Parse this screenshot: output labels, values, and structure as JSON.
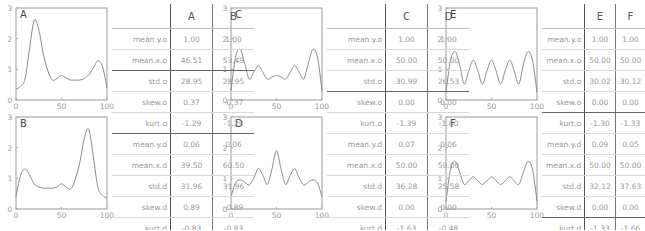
{
  "chart_data": [
    {
      "type": "line",
      "title": "A",
      "xlim": [
        0,
        100
      ],
      "ylim": [
        0,
        3
      ],
      "xticks": [
        0,
        50,
        100
      ],
      "yticks": [
        0,
        1,
        2,
        3
      ],
      "x": [
        0,
        5,
        10,
        15,
        20,
        25,
        30,
        35,
        40,
        45,
        50,
        55,
        60,
        65,
        70,
        75,
        80,
        85,
        90,
        95,
        100
      ],
      "values": [
        0.35,
        0.45,
        0.7,
        1.7,
        2.6,
        2.3,
        1.5,
        0.95,
        0.65,
        0.7,
        0.8,
        0.72,
        0.65,
        0.65,
        0.65,
        0.7,
        0.82,
        1.05,
        1.28,
        1.1,
        0.4
      ]
    },
    {
      "type": "line",
      "title": "B",
      "xlim": [
        0,
        100
      ],
      "ylim": [
        0,
        3
      ],
      "xticks": [
        0,
        50,
        100
      ],
      "yticks": [
        0,
        1,
        2,
        3
      ],
      "x": [
        0,
        5,
        10,
        15,
        20,
        25,
        30,
        35,
        40,
        45,
        50,
        55,
        60,
        65,
        70,
        75,
        80,
        85,
        90,
        95,
        100
      ],
      "values": [
        0.4,
        1.1,
        1.3,
        1.1,
        0.82,
        0.72,
        0.68,
        0.68,
        0.68,
        0.72,
        0.82,
        0.72,
        0.65,
        0.95,
        1.5,
        2.3,
        2.6,
        1.7,
        0.7,
        0.45,
        0.35
      ]
    },
    {
      "type": "line",
      "title": "C",
      "xlim": [
        0,
        100
      ],
      "ylim": [
        0,
        3
      ],
      "xticks": [
        0,
        50,
        100
      ],
      "yticks": [
        0,
        1,
        2,
        3
      ],
      "x": [
        0,
        5,
        10,
        15,
        20,
        25,
        30,
        35,
        40,
        45,
        50,
        55,
        60,
        65,
        70,
        75,
        80,
        85,
        90,
        95,
        100
      ],
      "values": [
        0.3,
        1.4,
        1.65,
        1.2,
        0.68,
        0.9,
        1.12,
        0.9,
        0.68,
        0.75,
        0.8,
        0.75,
        0.68,
        0.9,
        1.12,
        0.9,
        0.68,
        1.2,
        1.65,
        1.4,
        0.3
      ]
    },
    {
      "type": "line",
      "title": "D",
      "xlim": [
        0,
        100
      ],
      "ylim": [
        0,
        3
      ],
      "xticks": [
        0,
        50,
        100
      ],
      "yticks": [
        0,
        1,
        2,
        3
      ],
      "x": [
        0,
        5,
        10,
        15,
        20,
        25,
        30,
        35,
        40,
        45,
        50,
        55,
        60,
        65,
        70,
        75,
        80,
        85,
        90,
        95,
        100
      ],
      "values": [
        0.4,
        0.85,
        0.95,
        0.88,
        0.78,
        1.0,
        1.32,
        1.1,
        0.8,
        1.3,
        1.9,
        1.3,
        0.8,
        1.1,
        1.32,
        1.0,
        0.78,
        0.88,
        0.95,
        0.85,
        0.4
      ]
    },
    {
      "type": "line",
      "title": "E",
      "xlim": [
        0,
        100
      ],
      "ylim": [
        0,
        3
      ],
      "xticks": [
        0,
        50,
        100
      ],
      "yticks": [
        0,
        1,
        2,
        3
      ],
      "x": [
        0,
        5,
        10,
        15,
        20,
        25,
        30,
        35,
        40,
        45,
        50,
        55,
        60,
        65,
        70,
        75,
        80,
        85,
        90,
        95,
        100
      ],
      "values": [
        0.25,
        1.3,
        1.58,
        1.15,
        0.52,
        0.95,
        1.3,
        0.95,
        0.52,
        0.95,
        1.3,
        0.95,
        0.52,
        0.95,
        1.3,
        0.95,
        0.52,
        1.15,
        1.58,
        1.3,
        0.25
      ]
    },
    {
      "type": "line",
      "title": "F",
      "xlim": [
        0,
        100
      ],
      "ylim": [
        0,
        3
      ],
      "xticks": [
        0,
        50,
        100
      ],
      "yticks": [
        0,
        1,
        2,
        3
      ],
      "x": [
        0,
        5,
        10,
        15,
        20,
        25,
        30,
        35,
        40,
        45,
        50,
        55,
        60,
        65,
        70,
        75,
        80,
        85,
        90,
        95,
        100
      ],
      "values": [
        0.25,
        1.3,
        1.55,
        1.2,
        0.8,
        0.92,
        1.05,
        0.92,
        0.8,
        0.92,
        1.05,
        0.92,
        0.8,
        0.92,
        1.05,
        0.92,
        0.8,
        1.2,
        1.55,
        1.3,
        0.25
      ]
    }
  ],
  "tables": [
    {
      "columns": [
        "A",
        "B"
      ],
      "rows": [
        {
          "label": "mean.y.o",
          "values": [
            "1.00",
            "1.00"
          ]
        },
        {
          "label": "mean.x.o",
          "values": [
            "46.51",
            "53.49"
          ]
        },
        {
          "label": "std.o",
          "values": [
            "28.95",
            "28.95"
          ]
        },
        {
          "label": "skew.o",
          "values": [
            "0.37",
            "-0.37"
          ]
        },
        {
          "label": "kurt.o",
          "values": [
            "-1.29",
            "-1.29"
          ]
        },
        {
          "label": "mean.y.d",
          "values": [
            "0.06",
            "0.06"
          ]
        },
        {
          "label": "mean.x.d",
          "values": [
            "39.50",
            "60.50"
          ]
        },
        {
          "label": "std.d",
          "values": [
            "31.96",
            "31.96"
          ]
        },
        {
          "label": "skew.d",
          "values": [
            "0.89",
            "-0.89"
          ]
        },
        {
          "label": "kurt.d",
          "values": [
            "-0.83",
            "-0.83"
          ]
        }
      ]
    },
    {
      "columns": [
        "C",
        "D"
      ],
      "rows": [
        {
          "label": "mean.y.o",
          "values": [
            "1.00",
            "1.00"
          ]
        },
        {
          "label": "mean.x.o",
          "values": [
            "50.00",
            "50.00"
          ]
        },
        {
          "label": "std.o",
          "values": [
            "30.99",
            "26.53"
          ]
        },
        {
          "label": "skew.o",
          "values": [
            "0.00",
            "0.00"
          ]
        },
        {
          "label": "kurt.o",
          "values": [
            "-1.39",
            "-1.00"
          ]
        },
        {
          "label": "mean.y.d",
          "values": [
            "0.07",
            "0.06"
          ]
        },
        {
          "label": "mean.x.d",
          "values": [
            "50.00",
            "50.00"
          ]
        },
        {
          "label": "std.d",
          "values": [
            "36.28",
            "25.58"
          ]
        },
        {
          "label": "skew.d",
          "values": [
            "0.00",
            "0.00"
          ]
        },
        {
          "label": "kurt.d",
          "values": [
            "-1.63",
            "-0.48"
          ]
        }
      ]
    },
    {
      "columns": [
        "E",
        "F"
      ],
      "rows": [
        {
          "label": "mean.y.o",
          "values": [
            "1.00",
            "1.00"
          ]
        },
        {
          "label": "mean.x.o",
          "values": [
            "50.00",
            "50.00"
          ]
        },
        {
          "label": "std.o",
          "values": [
            "30.02",
            "30.12"
          ]
        },
        {
          "label": "skew.o",
          "values": [
            "0.00",
            "0.00"
          ]
        },
        {
          "label": "kurt.o",
          "values": [
            "-1.30",
            "-1.33"
          ]
        },
        {
          "label": "mean.y.d",
          "values": [
            "0.09",
            "0.05"
          ]
        },
        {
          "label": "mean.x.d",
          "values": [
            "50.00",
            "50.00"
          ]
        },
        {
          "label": "std.d",
          "values": [
            "32.12",
            "37.63"
          ]
        },
        {
          "label": "skew.d",
          "values": [
            "0.00",
            "0.00"
          ]
        },
        {
          "label": "kurt.d",
          "values": [
            "-1.33",
            "-1.66"
          ]
        }
      ]
    }
  ],
  "thick_after": [
    [
      1,
      4
    ],
    [
      2
    ],
    [
      3,
      8
    ]
  ]
}
